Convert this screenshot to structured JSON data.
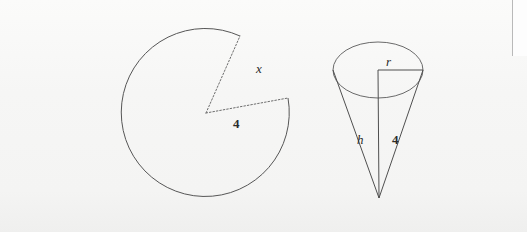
{
  "page": {
    "background_color": "#f8f8f7",
    "ink_color": "#4a4a4a",
    "label_color": "#2b2b2b",
    "width": 527,
    "height": 232
  },
  "figures": [
    {
      "id": "sector-circle",
      "name": "circle-with-removed-sector",
      "description": "Circle with a wedge removed; arc length labelled x and radius labelled 4",
      "center": {
        "x": 206,
        "y": 113
      },
      "radius": 84,
      "cut_radii": [
        {
          "label": "upper-radius",
          "endpoint": {
            "x": 240,
            "y": 36
          },
          "style": "dotted"
        },
        {
          "label": "lower-radius",
          "endpoint": {
            "x": 288,
            "y": 98
          },
          "style": "dotted"
        }
      ],
      "arc_style": "solid",
      "labels": {
        "arc": "x",
        "radius": "4"
      }
    },
    {
      "id": "cone",
      "name": "inverted-cone",
      "description": "Cone pointing downward with elliptical top face; height h, radius r, slant height 4",
      "top_ellipse": {
        "center": {
          "x": 378,
          "y": 70
        },
        "rx": 45,
        "ry": 28
      },
      "apex": {
        "x": 379,
        "y": 198
      },
      "labels": {
        "radius": "r",
        "height": "h",
        "slant": "4"
      }
    }
  ],
  "labels": {
    "sector_arc": "x",
    "sector_radius": "4",
    "cone_radius": "r",
    "cone_height": "h",
    "cone_slant": "4"
  }
}
